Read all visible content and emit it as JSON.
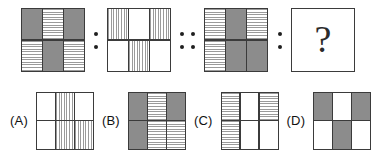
{
  "puzzle": {
    "type": "visual-analogy-matrix",
    "question_mark": "?",
    "fills": {
      "dark": "#8c8c8c",
      "white": "#ffffff",
      "hstripe": "#9a9a9a",
      "border": "#3b3b3b"
    },
    "analogy": {
      "separator_single": ":",
      "separator_double": "::",
      "figures": [
        {
          "name": "figure-1",
          "columns": 3,
          "rows": 2,
          "cells": [
            "dark",
            "hstripe",
            "dark",
            "hstripe",
            "dark",
            "hstripe"
          ]
        },
        {
          "name": "figure-2",
          "columns": 3,
          "rows": 2,
          "cells": [
            "vstripe",
            "white",
            "vstripe",
            "white",
            "vstripe",
            "white"
          ]
        },
        {
          "name": "figure-3",
          "columns": 3,
          "rows": 2,
          "cells": [
            "hstripe",
            "dark",
            "hstripe",
            "hstripe",
            "dark",
            "dark"
          ]
        },
        {
          "name": "figure-4-unknown",
          "columns": 1,
          "rows": 1,
          "cells": [
            "question"
          ]
        }
      ]
    },
    "options": [
      {
        "label": "(A)",
        "name": "option-a",
        "columns": 3,
        "rows": 2,
        "cells": [
          "white",
          "vstripe",
          "white",
          "white",
          "vstripe",
          "vstripe"
        ]
      },
      {
        "label": "(B)",
        "name": "option-b",
        "columns": 3,
        "rows": 2,
        "cells": [
          "dark",
          "hstripe",
          "dark",
          "dark",
          "hstripe",
          "hstripe"
        ]
      },
      {
        "label": "(C)",
        "name": "option-c",
        "columns": 3,
        "rows": 2,
        "cells": [
          "hstripe",
          "white",
          "hstripe",
          "hstripe",
          "white",
          "white"
        ]
      },
      {
        "label": "(D)",
        "name": "option-d",
        "columns": 3,
        "rows": 2,
        "cells": [
          "dark",
          "white",
          "dark",
          "white",
          "dark",
          "white"
        ]
      }
    ]
  }
}
